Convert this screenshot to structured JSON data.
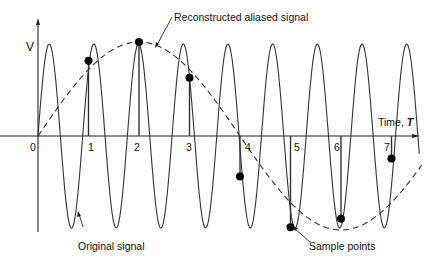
{
  "figure": {
    "y_axis_label": "V",
    "x_axis_label": "Time, ",
    "x_axis_label_italic": "T",
    "tick_labels": [
      "0",
      "1",
      "2",
      "3",
      "4",
      "5",
      "6",
      "7"
    ],
    "annotations": {
      "reconstructed": "Reconstructed aliased signal",
      "original": "Original signal",
      "samples": "Sample points"
    }
  },
  "chart_data": {
    "type": "line",
    "title": "",
    "xlabel": "Time, T",
    "ylabel": "V",
    "x_ticks": [
      0,
      1,
      2,
      3,
      4,
      5,
      6,
      7
    ],
    "series": [
      {
        "name": "Original signal",
        "style": "solid",
        "description": "high-frequency sinusoid, about 9 cycles per 8 time units (frequency ≈ 1.125 per unit), amplitude ≈ 1"
      },
      {
        "name": "Reconstructed aliased signal",
        "style": "dashed",
        "description": "low-frequency sinusoid, period ≈ 8 time units, peak near T=2, trough near T=6"
      }
    ],
    "sample_points": [
      {
        "t": 1,
        "v": 0.8
      },
      {
        "t": 2,
        "v": 1.0
      },
      {
        "t": 3,
        "v": 0.62
      },
      {
        "t": 4,
        "v": -0.43
      },
      {
        "t": 5,
        "v": -0.97
      },
      {
        "t": 6,
        "v": -0.88
      },
      {
        "t": 7,
        "v": -0.24
      }
    ]
  }
}
